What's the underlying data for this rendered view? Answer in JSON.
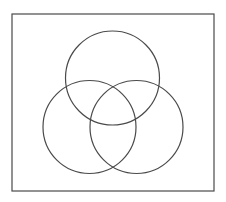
{
  "diagram": {
    "type": "venn-diagram",
    "set_count": 3,
    "stroke_color": "#4a4a4a",
    "background": "#ffffff",
    "frame": {
      "x": 12,
      "y": 14,
      "width": 202,
      "height": 177
    },
    "circles": [
      {
        "id": "top",
        "cx": 112.5,
        "cy": 78,
        "r": 47
      },
      {
        "id": "left",
        "cx": 89.5,
        "cy": 127,
        "r": 46.5
      },
      {
        "id": "right",
        "cx": 136.5,
        "cy": 127,
        "r": 46.5
      }
    ],
    "labels": []
  }
}
